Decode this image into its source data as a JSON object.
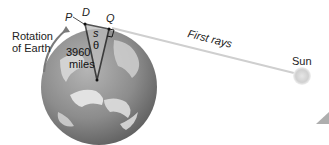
{
  "diagram": {
    "labels": {
      "rotation": [
        "Rotation",
        "of Earth"
      ],
      "point_p": "P",
      "point_d": "D",
      "point_q": "Q",
      "arc_s": "s",
      "angle_theta": "θ",
      "radius_value": "3960",
      "radius_unit": "miles",
      "rays": "First rays",
      "sun": "Sun"
    },
    "colors": {
      "globe_land": "#dcdcdc",
      "globe_ocean": "#8a8a8a",
      "triangle_fill": "#bfbfbf",
      "triangle_stroke": "#1a1a1a",
      "ray": "#c8c8c8",
      "sun": "#d9d9d9",
      "rotation_arrow": "#7a7a7a"
    }
  }
}
